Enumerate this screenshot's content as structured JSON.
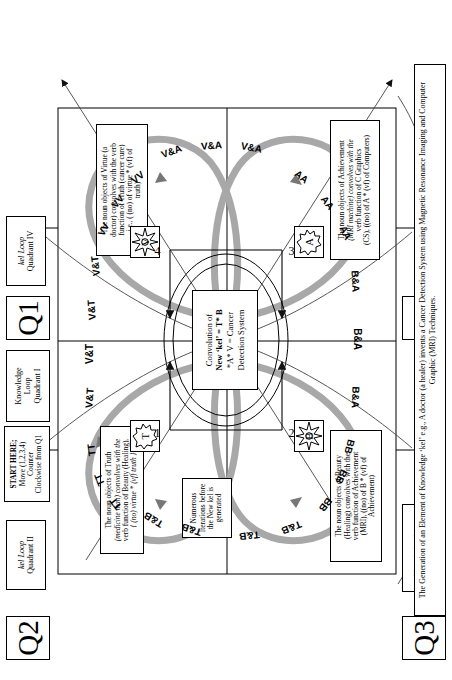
{
  "figure": {
    "caption": "The Generation of an Element of Knowledge ‘kel’ e.g., A doctor (a healer) invents a Cancer Detection System using Magnetic Resonance Imaging and Computer Graphic (MRI) Techniques."
  },
  "quadrant_badges": {
    "q1": "Q1",
    "q2": "Q2",
    "q3": "Q3",
    "q4": "Q4"
  },
  "loop_labels": {
    "q1": "Knowledge Loop Quadrant I",
    "q1_line1": "Knowledge",
    "q1_line2": "Loop",
    "q1_line3": "Quadrant I",
    "q2_line1": "kel Loop",
    "q2_line2": "Quadrant II",
    "q3_line1": "Knowledge Loop",
    "q3_line2": "Quadrant III",
    "q4_line1": "kel Loop",
    "q4_line2": "Quadrant IV"
  },
  "start_note": {
    "line1": "START HERE;",
    "line2": "Move (1,2,3,4) Counter",
    "line3": "Clockwise from Q1"
  },
  "iterations_note": {
    "line1": "Numerous",
    "line2": "Iterations before",
    "line3": "the New kel is",
    "line4": "generated"
  },
  "central_box": {
    "line1": "Convolution of",
    "line2": "New ‘kel’ = T* B",
    "line3": "*A* V = Cancer",
    "line4": "Detection System"
  },
  "notes": {
    "truth": {
      "line1": "The noun objects of Truth",
      "line2": "(medicine man) convolves with the",
      "line3": "verb function of Beauty (Healing),",
      "line4": "{ (no) virtue * (vf) truth }"
    },
    "virtue": {
      "line1": "The noun objects of Virtue (a",
      "line2": "doctor) convolves with the verb",
      "line3": "function of Truth (cancer cure)",
      "line4": "i.e., ( (no) of virtue * (vf) of",
      "line5": "truth)"
    },
    "beauty": {
      "line1": "The noun objects of Beauty",
      "line2": "(Healing) convolves with the",
      "line3": "verb function of Achievement",
      "line4": "(MRI), ((no) of B * (vf) of",
      "line5": "Achievement)"
    },
    "achievement": {
      "line1": "The noun objects of Achievement",
      "line2": "(MRI machine) convolves with the",
      "line3": "verb function of C Graphics",
      "line4": "(CS), ((no) of A * (vf) of Computers)"
    }
  },
  "numbers": {
    "n1": "1",
    "n2": "2",
    "n3": "3",
    "n4": "4"
  },
  "icons": {
    "star_t": "T",
    "star_b": "B",
    "star_a": "A",
    "star_v": "V"
  },
  "arc_labels": {
    "tb_a": "T&B",
    "tb_b": "T&B",
    "tt_a": "TT",
    "tt_b": "TT",
    "tt_c": "TT",
    "vt_a": "V&T",
    "vt_b": "V&T",
    "vt_c": "V&T",
    "vt_d": "V&T",
    "vv_a": "VV",
    "vv_b": "VV",
    "vv_c": "VV",
    "va_a": "V&A",
    "va_b": "V&A",
    "va_c": "V&A",
    "aa_a": "AA",
    "aa_b": "AA",
    "aa_c": "AA",
    "ba_a": "B&A",
    "ba_b": "B&A",
    "ba_c": "B&A",
    "bb_a": "BB",
    "bb_b": "BB",
    "bb_c": "BB",
    "tb_c": "T&B",
    "tb_d": "T&B"
  },
  "colors": {
    "ink": "#000000",
    "paper": "#ffffff",
    "loop_gray": "#9a9a9a",
    "loop_gray_light": "#bdbdbd"
  }
}
